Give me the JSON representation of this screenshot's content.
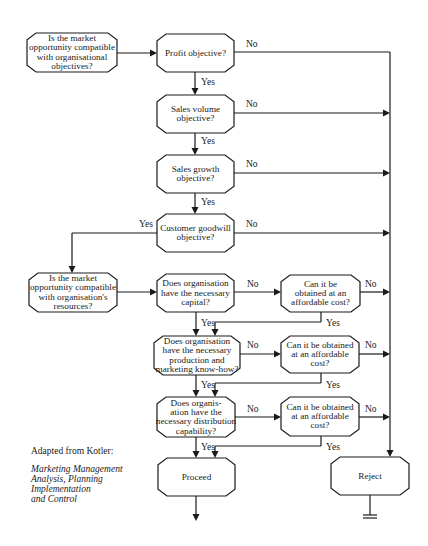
{
  "diagram": {
    "colors": {
      "ink": "#1a1a1a",
      "background": "#ffffff"
    },
    "nodes": [
      {
        "id": "start_compat",
        "x": 27,
        "y": 33,
        "w": 90,
        "h": 39,
        "lines": [
          "Is the market",
          "opportunity compatible",
          "with organisational",
          "objectives?"
        ]
      },
      {
        "id": "profit",
        "x": 157,
        "y": 34,
        "w": 77,
        "h": 38,
        "lines": [
          "Profit objective?"
        ]
      },
      {
        "id": "sales_volume",
        "x": 157,
        "y": 95,
        "w": 77,
        "h": 38,
        "lines": [
          "Sales volume",
          "objective?"
        ]
      },
      {
        "id": "sales_growth",
        "x": 157,
        "y": 155,
        "w": 77,
        "h": 38,
        "lines": [
          "Sales growth",
          "objective?"
        ]
      },
      {
        "id": "goodwill",
        "x": 157,
        "y": 214,
        "w": 77,
        "h": 38,
        "lines": [
          "Customer goodwill",
          "objective?"
        ]
      },
      {
        "id": "resources_compat",
        "x": 29,
        "y": 273,
        "w": 88,
        "h": 39,
        "lines": [
          "Is the market",
          "opportunity compatible",
          "with organisation's",
          "resources?"
        ]
      },
      {
        "id": "capital",
        "x": 157,
        "y": 274,
        "w": 77,
        "h": 38,
        "lines": [
          "Does organisation",
          "have the necessary",
          "capital?"
        ]
      },
      {
        "id": "capital_cost",
        "x": 281,
        "y": 275,
        "w": 79,
        "h": 37,
        "lines": [
          "Can it be",
          "obtained at an",
          "affordable cost?"
        ]
      },
      {
        "id": "knowhow",
        "x": 154,
        "y": 336,
        "w": 86,
        "h": 39,
        "lines": [
          "Does organisation",
          "have the necessary",
          "production and",
          "marketing know-how?"
        ]
      },
      {
        "id": "knowhow_cost",
        "x": 281,
        "y": 336,
        "w": 78,
        "h": 37,
        "lines": [
          "Can it be obtained",
          "at an affordable",
          "cost?"
        ]
      },
      {
        "id": "distribution",
        "x": 157,
        "y": 397,
        "w": 78,
        "h": 40,
        "lines": [
          "Does organis-",
          "ation have the",
          "necessary distribution",
          "capability?"
        ]
      },
      {
        "id": "distribution_cost",
        "x": 281,
        "y": 397,
        "w": 78,
        "h": 39,
        "lines": [
          "Can it be obtained",
          "at an affordable",
          "cost?"
        ]
      },
      {
        "id": "proceed",
        "x": 158,
        "y": 458,
        "w": 77,
        "h": 38,
        "lines": [
          "Proceed"
        ]
      },
      {
        "id": "reject",
        "x": 331,
        "y": 457,
        "w": 78,
        "h": 38,
        "lines": [
          "Reject"
        ]
      }
    ],
    "edge_labels": [
      {
        "text": "No",
        "x": 246,
        "y": 47
      },
      {
        "text": "Yes",
        "x": 201,
        "y": 85
      },
      {
        "text": "No",
        "x": 246,
        "y": 107
      },
      {
        "text": "Yes",
        "x": 201,
        "y": 144
      },
      {
        "text": "No",
        "x": 246,
        "y": 167
      },
      {
        "text": "Yes",
        "x": 201,
        "y": 205
      },
      {
        "text": "Yes",
        "x": 139,
        "y": 227
      },
      {
        "text": "No",
        "x": 246,
        "y": 227
      },
      {
        "text": "No",
        "x": 247,
        "y": 287
      },
      {
        "text": "No",
        "x": 365,
        "y": 287
      },
      {
        "text": "Yes",
        "x": 201,
        "y": 326
      },
      {
        "text": "Yes",
        "x": 326,
        "y": 326
      },
      {
        "text": "No",
        "x": 247,
        "y": 348
      },
      {
        "text": "No",
        "x": 365,
        "y": 348
      },
      {
        "text": "Yes",
        "x": 201,
        "y": 388
      },
      {
        "text": "Yes",
        "x": 326,
        "y": 388
      },
      {
        "text": "No",
        "x": 247,
        "y": 412
      },
      {
        "text": "No",
        "x": 365,
        "y": 412
      },
      {
        "text": "Yes",
        "x": 201,
        "y": 450
      },
      {
        "text": "Yes",
        "x": 326,
        "y": 450
      }
    ]
  },
  "caption": {
    "source": "Adapted from Kotler:",
    "book_lines": [
      "Marketing Management",
      "Analysis, Planning",
      "Implementation",
      "and Control"
    ]
  }
}
